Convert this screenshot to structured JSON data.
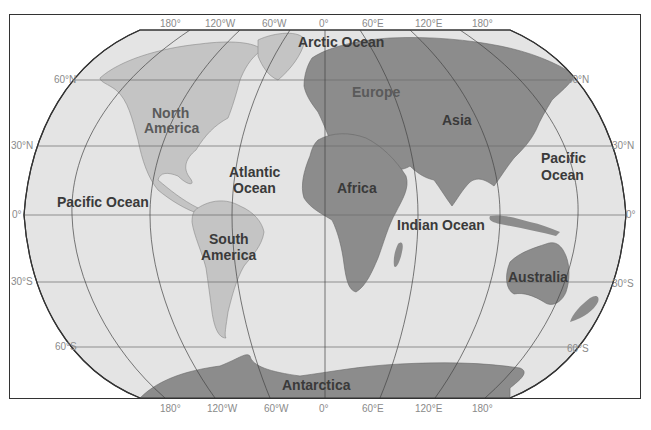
{
  "map": {
    "projection": "Robinson",
    "colors": {
      "ocean": "#e4e4e4",
      "land_light": "#c4c4c4",
      "land_dark": "#8c8c8c",
      "grid": "#555555",
      "border": "#333333",
      "tick_label": "#8a8a8a",
      "label": "#3a3a3a"
    },
    "longitude_labels_top": [
      "180°",
      "120°W",
      "60°W",
      "0°",
      "60°E",
      "120°E",
      "180°"
    ],
    "longitude_labels_bottom": [
      "180°",
      "120°W",
      "60°W",
      "0°",
      "60°E",
      "120°E",
      "180°"
    ],
    "latitude_labels_left": [
      "60°N",
      "30°N",
      "0°",
      "30°S",
      "60°S"
    ],
    "latitude_labels_right": [
      "60°N",
      "30°N",
      "0°",
      "30°S",
      "60°S"
    ],
    "oceans": [
      {
        "name": "Arctic Ocean"
      },
      {
        "name": "Atlantic",
        "name2": "Ocean"
      },
      {
        "name": "Pacific Ocean"
      },
      {
        "name": "Pacific",
        "name2": "Ocean"
      },
      {
        "name": "Indian Ocean"
      }
    ],
    "continents": [
      {
        "name": "North",
        "name2": "America"
      },
      {
        "name": "South",
        "name2": "America"
      },
      {
        "name": "Europe"
      },
      {
        "name": "Asia"
      },
      {
        "name": "Africa"
      },
      {
        "name": "Australia"
      },
      {
        "name": "Antarctica"
      }
    ]
  }
}
